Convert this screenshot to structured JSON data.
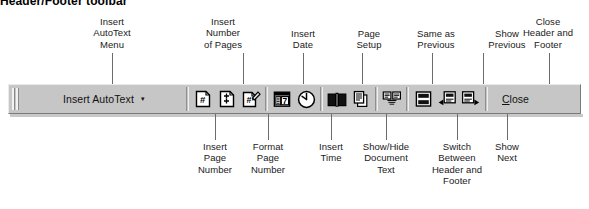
{
  "figure": {
    "heading": "Header/Footer toolbar"
  },
  "toolbar": {
    "name": "Header and Footer toolbar",
    "background_color": "#c6c6c6",
    "grip": "drag-grip",
    "autotext": {
      "label": "Insert AutoText",
      "caret": "▾"
    },
    "close": {
      "label": "Close"
    },
    "buttons": [
      {
        "id": "insert-page-number",
        "icon": "page-with-hash-icon",
        "tooltip": "Insert Page Number"
      },
      {
        "id": "insert-number-of-pages",
        "icon": "page-with-plus-icon",
        "tooltip": "Insert Number of Pages"
      },
      {
        "id": "format-page-number",
        "icon": "page-with-hash-pencil-icon",
        "tooltip": "Format Page Number"
      },
      {
        "id": "insert-date",
        "icon": "calendar-icon",
        "tooltip": "Insert Date"
      },
      {
        "id": "insert-time",
        "icon": "clock-icon",
        "tooltip": "Insert Time"
      },
      {
        "id": "page-setup",
        "icon": "open-book-icon",
        "tooltip": "Page Setup"
      },
      {
        "id": "show-hide-document-text",
        "icon": "document-text-icon",
        "tooltip": "Show/Hide Document Text"
      },
      {
        "id": "same-as-previous",
        "icon": "link-to-previous-icon",
        "tooltip": "Same as Previous"
      },
      {
        "id": "switch-header-footer",
        "icon": "switch-header-footer-icon",
        "tooltip": "Switch Between Header and Footer"
      },
      {
        "id": "show-previous",
        "icon": "show-previous-icon",
        "tooltip": "Show Previous"
      },
      {
        "id": "show-next",
        "icon": "show-next-icon",
        "tooltip": "Show Next"
      }
    ]
  },
  "callouts": {
    "top": [
      {
        "id": "insert-autotext-menu",
        "text": "Insert\nAutoText\nMenu"
      },
      {
        "id": "insert-number-of-pages",
        "text": "Insert\nNumber\nof Pages"
      },
      {
        "id": "insert-date",
        "text": "Insert\nDate"
      },
      {
        "id": "page-setup",
        "text": "Page\nSetup"
      },
      {
        "id": "same-as-previous",
        "text": "Same as\nPrevious"
      },
      {
        "id": "show-previous",
        "text": "Show\nPrevious"
      },
      {
        "id": "close-header-and-footer",
        "text": "Close\nHeader and\nFooter"
      }
    ],
    "bottom": [
      {
        "id": "insert-page-number",
        "text": "Insert\nPage\nNumber"
      },
      {
        "id": "format-page-number",
        "text": "Format\nPage\nNumber"
      },
      {
        "id": "insert-time",
        "text": "Insert\nTime"
      },
      {
        "id": "show-hide-document-text",
        "text": "Show/Hide\nDocument\nText"
      },
      {
        "id": "switch-header-and-footer",
        "text": "Switch\nBetween\nHeader and\nFooter"
      },
      {
        "id": "show-next",
        "text": "Show\nNext"
      }
    ]
  }
}
